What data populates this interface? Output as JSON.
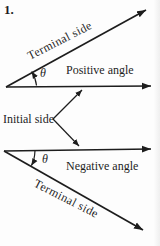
{
  "figure": {
    "number": "1.",
    "positive": {
      "terminal_label": "Terminal side",
      "angle_label": "Positive angle",
      "theta": "θ"
    },
    "initial_label": "Initial side",
    "negative": {
      "terminal_label": "Terminal side",
      "angle_label": "Negative angle",
      "theta": "θ"
    },
    "colors": {
      "ink": "#1d1d1d",
      "background": "#fdfdfd"
    }
  }
}
